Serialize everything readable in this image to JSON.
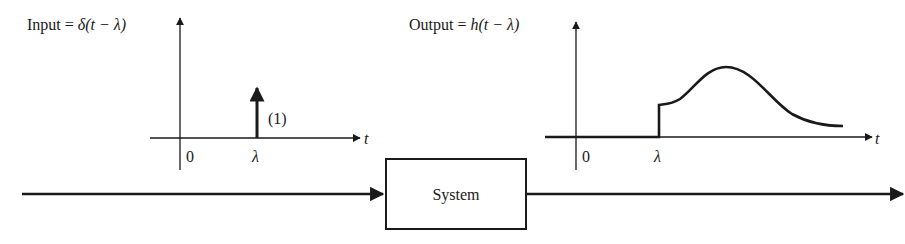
{
  "input_plot": {
    "label_prefix": "Input = ",
    "label_func": "δ",
    "label_arg": "(t − λ)",
    "origin_label": "0",
    "shift_label": "λ",
    "axis_label": "t",
    "impulse_weight": "(1)"
  },
  "output_plot": {
    "label_prefix": "Output = ",
    "label_func": "h",
    "label_arg": "(t − λ)",
    "origin_label": "0",
    "shift_label": "λ",
    "axis_label": "t"
  },
  "system_block": {
    "label": "System"
  },
  "colors": {
    "ink": "#1a1a1a",
    "background": "#ffffff"
  }
}
